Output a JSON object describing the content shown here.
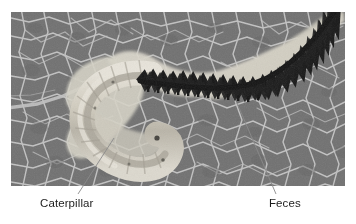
{
  "figure": {
    "kind": "annotated-photograph",
    "photo": {
      "x": 11,
      "y": 12,
      "width": 334,
      "height": 174,
      "background_color": "#6e6e6e",
      "vein_color": "#c9c9c9",
      "caterpillar_color": "#d9d5cb",
      "feces_color": "#0d0d0d"
    }
  },
  "annotations": [
    {
      "id": "caterpillar",
      "label": "Caterpillar",
      "leader": {
        "x1": 114,
        "y1": 138,
        "x2": 78,
        "y2": 194
      },
      "label_position": {
        "x": 40,
        "y": 197
      }
    },
    {
      "id": "feces",
      "label": "Feces",
      "leader": {
        "x1": 237,
        "y1": 103,
        "x2": 276,
        "y2": 194
      },
      "label_position": {
        "x": 269,
        "y": 197
      }
    }
  ],
  "colors": {
    "text": "#1d1d1d",
    "leader_line": "#8a8a8a",
    "page_background": "#ffffff"
  }
}
